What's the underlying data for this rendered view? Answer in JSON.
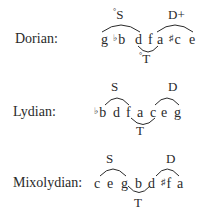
{
  "modes": [
    {
      "name": "Dorian:",
      "notes": [
        {
          "acc": "",
          "letter": "g"
        },
        {
          "acc": "♭",
          "letter": "b"
        },
        {
          "acc": "",
          "letter": "d"
        },
        {
          "acc": "",
          "letter": "f"
        },
        {
          "acc": "",
          "letter": "a"
        },
        {
          "acc": "♯",
          "letter": "c"
        },
        {
          "acc": "",
          "letter": "e"
        }
      ],
      "subdominant": {
        "prefix": "°",
        "label": "S"
      },
      "dominant": {
        "label": "D+"
      },
      "tonic": {
        "prefix": "°",
        "label": "T"
      }
    },
    {
      "name": "Lydian:",
      "notes": [
        {
          "acc": "♭",
          "letter": "b"
        },
        {
          "acc": "",
          "letter": "d"
        },
        {
          "acc": "",
          "letter": "f"
        },
        {
          "acc": "",
          "letter": "a"
        },
        {
          "acc": "",
          "letter": "c"
        },
        {
          "acc": "",
          "letter": "e"
        },
        {
          "acc": "",
          "letter": "g"
        }
      ],
      "subdominant": {
        "prefix": "",
        "label": "S"
      },
      "dominant": {
        "label": "D"
      },
      "tonic": {
        "prefix": "",
        "label": "T"
      }
    },
    {
      "name": "Mixolydian:",
      "notes": [
        {
          "acc": "",
          "letter": "c"
        },
        {
          "acc": "",
          "letter": "e"
        },
        {
          "acc": "",
          "letter": "g"
        },
        {
          "acc": "",
          "letter": "b"
        },
        {
          "acc": "",
          "letter": "d"
        },
        {
          "acc": "♯",
          "letter": "f"
        },
        {
          "acc": "",
          "letter": "a"
        }
      ],
      "subdominant": {
        "prefix": "",
        "label": "S"
      },
      "dominant": {
        "label": "D"
      },
      "tonic": {
        "prefix": "",
        "label": "T"
      }
    }
  ]
}
